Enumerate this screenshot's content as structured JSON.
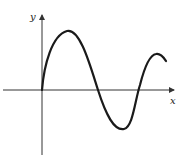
{
  "diagram": {
    "type": "function-graph",
    "axes": {
      "x_label": "x",
      "y_label": "y"
    },
    "colors": {
      "curve": "#1a1a1a",
      "axes": "#333333",
      "background": "#ffffff"
    }
  }
}
